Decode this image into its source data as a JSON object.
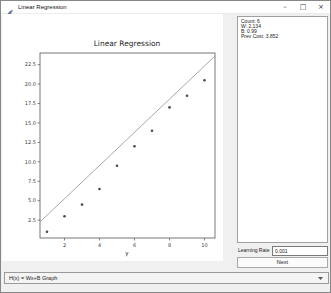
{
  "window": {
    "title": "Linear Regression",
    "controls": {
      "minimize": "–",
      "maximize": "□",
      "close": "×"
    }
  },
  "stats_panel": {
    "lines": [
      "Count: 6",
      "W: 2.134",
      "B: 0.99",
      "Prev Cost: 3.852"
    ]
  },
  "controls": {
    "learning_rate_label": "Learning Rate",
    "learning_rate_value": "0.001",
    "next_label": "Next"
  },
  "graph_selector": {
    "value": "H(x) = Wx+B Graph"
  },
  "chart_data": {
    "type": "scatter",
    "title": "Linear Regression",
    "xlabel": "y",
    "ylabel": "",
    "x": [
      1,
      2,
      3,
      4,
      5,
      6,
      7,
      8,
      9,
      10
    ],
    "y": [
      1,
      3,
      4.5,
      6.5,
      9.5,
      12,
      14,
      17,
      18.5,
      20.5
    ],
    "fit_line": {
      "type": "linear",
      "w": 2.134,
      "b": 0.99
    },
    "xtick_labels": [
      "2",
      "4",
      "6",
      "8",
      "10"
    ],
    "ytick_labels": [
      "2.5",
      "5.0",
      "7.5",
      "10.0",
      "12.5",
      "15.0",
      "17.5",
      "20.0",
      "22.5"
    ],
    "xlim": [
      0.6,
      10.6
    ],
    "ylim": [
      0.2,
      24.0
    ],
    "grid": false,
    "legend": "none",
    "point_color": "#4a4a4a",
    "line_color": "#909090",
    "frame_color": "#555555"
  },
  "colors": {
    "window_bg": "#f0f0f0",
    "titlebar_bg": "#ffffff",
    "figure_bg": "#ffffff",
    "panel_border": "#a0a0a0",
    "text": "#1a1a1a"
  }
}
